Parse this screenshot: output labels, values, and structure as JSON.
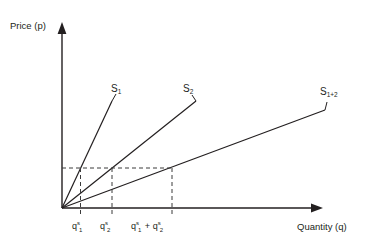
{
  "figure": {
    "axes": {
      "y_title": "Price (p)",
      "x_title": "Quantity (q)"
    },
    "curves": [
      {
        "id": "s1",
        "label_base": "S",
        "label_sub": "1",
        "label_full": "S1"
      },
      {
        "id": "s2",
        "label_base": "S",
        "label_sub": "2",
        "label_full": "S2"
      },
      {
        "id": "s12",
        "label_base": "S",
        "label_sub": "1+2",
        "label_full": "S1+2"
      }
    ],
    "x_ticks": [
      {
        "id": "q1",
        "base": "q",
        "sup": "s",
        "sub": "1",
        "suffix": "",
        "full": "qs1"
      },
      {
        "id": "q2",
        "base": "q",
        "sup": "s",
        "sub": "2",
        "suffix": "",
        "full": "qs2"
      },
      {
        "id": "qsum",
        "base": "q",
        "sup": "s",
        "sub": "1",
        "suffix": " + ",
        "base2": "q",
        "sup2": "s",
        "sub2": "2",
        "full": "qs1 + qs2"
      }
    ],
    "colors": {
      "line": "#231f20",
      "dashed": "#3b3b3b",
      "text": "#231f20",
      "background": "#ffffff"
    }
  }
}
